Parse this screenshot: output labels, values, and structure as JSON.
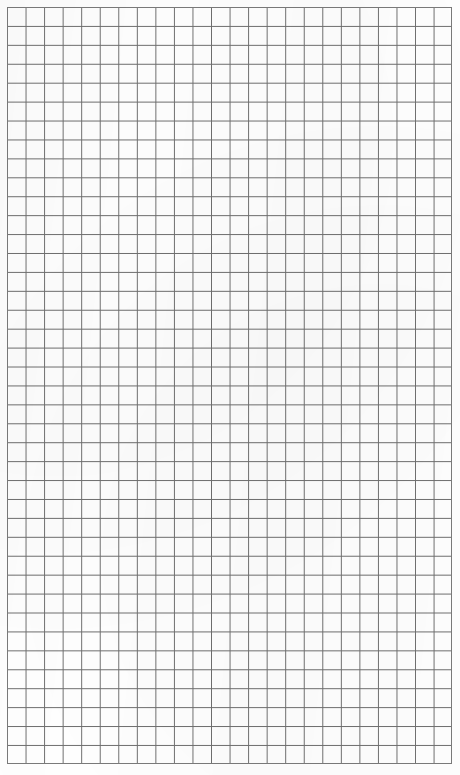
{
  "page": {
    "kind": "grid-paper-sheet",
    "width_px": 460,
    "height_px": 775,
    "background_color": "#ffffff"
  },
  "grid": {
    "label": "blank square grid paper",
    "columns": 24,
    "rows": 40,
    "cell_width_px": 18.55,
    "cell_height_px": 18.93,
    "origin_x_px": 7,
    "origin_y_px": 7,
    "extent_right_px": 452,
    "extent_bottom_px": 764,
    "line_color": "#6e6e6e",
    "line_color_light": "#9a9a9a",
    "line_width_px": 1,
    "border_color": "#7a7a7a",
    "border_width_px": 1
  },
  "content": {
    "text_items": [],
    "annotations": [],
    "note": ""
  }
}
